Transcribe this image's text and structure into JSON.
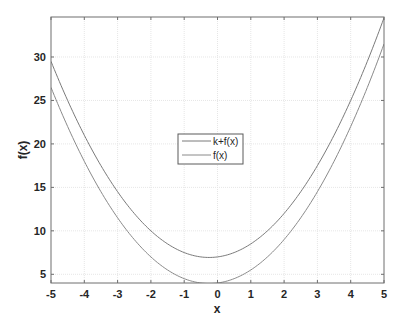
{
  "chart_data": {
    "type": "line",
    "title": "",
    "xlabel": "x",
    "ylabel": "f(x)",
    "xlim": [
      -5,
      5
    ],
    "ylim": [
      4,
      34.6
    ],
    "grid": true,
    "legend_position": "center",
    "x_ticks": [
      -5,
      -4,
      -3,
      -2,
      -1,
      0,
      1,
      2,
      3,
      4,
      5
    ],
    "y_ticks": [
      5,
      10,
      15,
      20,
      25,
      30
    ],
    "x": [
      -5,
      -4,
      -3,
      -2,
      -1,
      -0.25,
      0,
      1,
      2,
      3,
      4,
      5
    ],
    "series": [
      {
        "name": "k+f(x)",
        "values": [
          29.5,
          21,
          14.5,
          10,
          7.5,
          6.94,
          7,
          8.5,
          12,
          17.5,
          25,
          34.5
        ],
        "color": "#7a7a7a"
      },
      {
        "name": "f(x)",
        "values": [
          26.5,
          18,
          11.5,
          7,
          4.5,
          3.94,
          4,
          5.5,
          9,
          14.5,
          22,
          31.5
        ],
        "color": "#8a8a8a"
      }
    ],
    "annotations": []
  },
  "legend": {
    "items": [
      {
        "label": "k+f(x)"
      },
      {
        "label": "f(x)"
      }
    ]
  },
  "axes": {
    "xlabel": "x",
    "ylabel": "f(x)"
  }
}
